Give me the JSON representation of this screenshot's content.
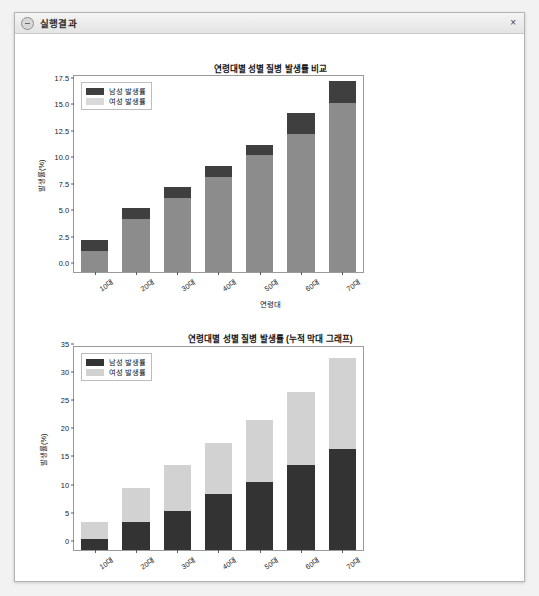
{
  "window": {
    "title": "실행결과",
    "icon": "app-circle-icon",
    "close_label": "×"
  },
  "palette": {
    "male_dark": "#3f3f3f",
    "male_gray": "#8c8c8c",
    "female_light": "#d9d9d9",
    "axis": "#9a9a9a",
    "text": "#1a1a1a"
  },
  "chart_data": [
    {
      "type": "bar",
      "id": "overlay-bar-chart",
      "title": "연령대별 성별 질병 발생률 비교",
      "xlabel": "연령대",
      "ylabel": "발생률(%)",
      "categories": [
        "10대",
        "20대",
        "30대",
        "40대",
        "50대",
        "60대",
        "70대"
      ],
      "series": [
        {
          "name": "남성 발생률",
          "color": "#3f3f3f",
          "values": [
            2,
            5,
            7,
            9,
            11,
            13,
            16
          ]
        },
        {
          "name": "여성 발생률",
          "color": "#d9d9d9",
          "values": [
            3,
            6,
            8,
            10,
            12,
            15,
            18
          ]
        }
      ],
      "totals": [
        3,
        6,
        8,
        10,
        12,
        15,
        18
      ],
      "ylim": [
        0,
        18.5
      ],
      "yticks": [
        "0.0",
        "2.5",
        "5.0",
        "7.5",
        "10.0",
        "12.5",
        "15.0",
        "17.5"
      ],
      "ytick_values": [
        0,
        2.5,
        5,
        7.5,
        10,
        12.5,
        15,
        17.5
      ],
      "grid": false,
      "legend_position": "upper left",
      "note": "막대는 여성 총합 위에 남성 값이 겹쳐 그려진 오버레이 형태"
    },
    {
      "type": "bar",
      "id": "stacked-bar-chart",
      "title": "연령대별 성별 질병 발생률 (누적 막대 그래프)",
      "xlabel": "연령대",
      "ylabel": "발생률(%)",
      "categories": [
        "10대",
        "20대",
        "30대",
        "40대",
        "50대",
        "60대",
        "70대"
      ],
      "series": [
        {
          "name": "남성 발생률",
          "color": "#333333",
          "values": [
            2,
            5,
            7,
            10,
            12,
            15,
            18
          ]
        },
        {
          "name": "여성 발생률",
          "color": "#d2d2d2",
          "values": [
            3,
            6,
            8,
            9,
            11,
            13,
            16
          ]
        }
      ],
      "totals": [
        5,
        11,
        15,
        19,
        23,
        28,
        34
      ],
      "ylim": [
        0,
        36
      ],
      "yticks": [
        "0",
        "5",
        "10",
        "15",
        "20",
        "25",
        "30",
        "35"
      ],
      "ytick_values": [
        0,
        5,
        10,
        15,
        20,
        25,
        30,
        35
      ],
      "grid": false,
      "legend_position": "upper left",
      "stacked": true
    }
  ]
}
